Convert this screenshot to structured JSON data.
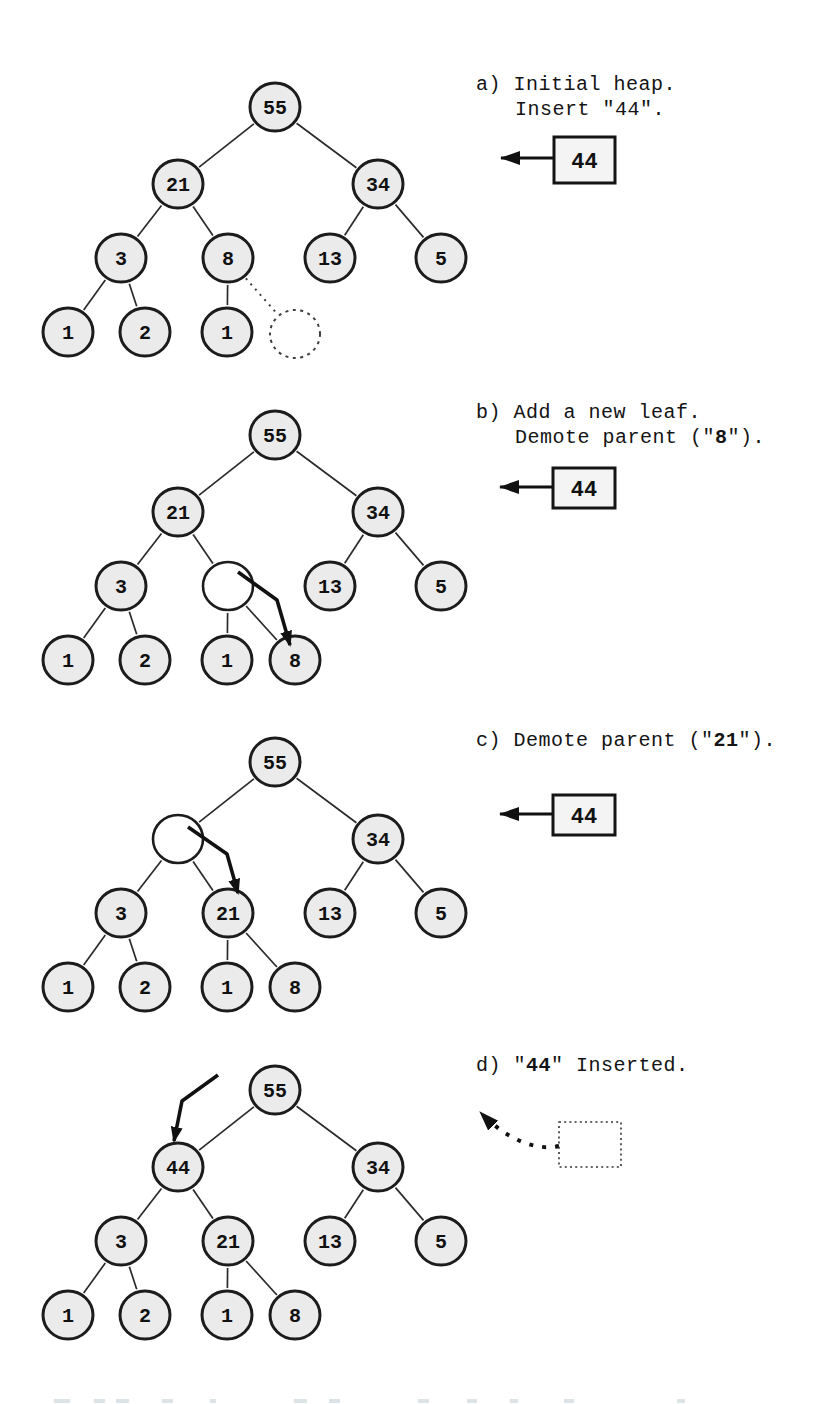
{
  "page": {
    "background": "#ffffff",
    "ink": "#1c1c1c"
  },
  "styles": {
    "node_fill": "#ebebeb",
    "empty_fill": "#ffffff",
    "edge_color": "#2b2b2b",
    "box_fill": "#f4f4f4",
    "accent": "#111111",
    "artifact_color": "#dde4e8"
  },
  "panels": [
    {
      "id": "a",
      "caption": {
        "x": 476,
        "y": 72,
        "lines": [
          {
            "indent": false,
            "segments": [
              {
                "text": "a) Initial heap."
              }
            ]
          },
          {
            "indent": true,
            "segments": [
              {
                "text": "Insert \"44\"."
              }
            ]
          }
        ]
      },
      "nodes": [
        {
          "key": "n55",
          "label": "55",
          "x": 275,
          "y": 107,
          "style": "filled"
        },
        {
          "key": "n21",
          "label": "21",
          "x": 178,
          "y": 184,
          "style": "filled"
        },
        {
          "key": "n34",
          "label": "34",
          "x": 378,
          "y": 184,
          "style": "filled"
        },
        {
          "key": "n3",
          "label": "3",
          "x": 121,
          "y": 258,
          "style": "filled"
        },
        {
          "key": "n8",
          "label": "8",
          "x": 228,
          "y": 258,
          "style": "filled"
        },
        {
          "key": "n13",
          "label": "13",
          "x": 330,
          "y": 258,
          "style": "filled"
        },
        {
          "key": "n5",
          "label": "5",
          "x": 441,
          "y": 258,
          "style": "filled"
        },
        {
          "key": "l1",
          "label": "1",
          "x": 68,
          "y": 332,
          "style": "filled"
        },
        {
          "key": "l2",
          "label": "2",
          "x": 145,
          "y": 332,
          "style": "filled"
        },
        {
          "key": "l3",
          "label": "1",
          "x": 227,
          "y": 332,
          "style": "filled"
        },
        {
          "key": "l4",
          "label": "",
          "x": 295,
          "y": 334,
          "style": "ghost"
        }
      ],
      "edges": [
        [
          "n55",
          "n21",
          "solid"
        ],
        [
          "n55",
          "n34",
          "solid"
        ],
        [
          "n21",
          "n3",
          "solid"
        ],
        [
          "n21",
          "n8",
          "solid"
        ],
        [
          "n34",
          "n13",
          "solid"
        ],
        [
          "n34",
          "n5",
          "solid"
        ],
        [
          "n3",
          "l1",
          "solid"
        ],
        [
          "n3",
          "l2",
          "solid"
        ],
        [
          "n8",
          "l3",
          "solid"
        ],
        [
          "n8",
          "l4",
          "dotted"
        ]
      ],
      "arrows": [],
      "insert_box": {
        "value": "44",
        "x": 554,
        "y": 137,
        "w": 61,
        "h": 46,
        "arrow_y": 158
      }
    },
    {
      "id": "b",
      "caption": {
        "x": 476,
        "y": 400,
        "lines": [
          {
            "indent": false,
            "segments": [
              {
                "text": "b) Add a new leaf."
              }
            ]
          },
          {
            "indent": true,
            "segments": [
              {
                "text": "Demote parent (\""
              },
              {
                "text": "8",
                "bold": true
              },
              {
                "text": "\")."
              }
            ]
          }
        ]
      },
      "nodes": [
        {
          "key": "n55",
          "label": "55",
          "x": 275,
          "y": 435,
          "style": "filled"
        },
        {
          "key": "n21",
          "label": "21",
          "x": 178,
          "y": 512,
          "style": "filled"
        },
        {
          "key": "n34",
          "label": "34",
          "x": 378,
          "y": 512,
          "style": "filled"
        },
        {
          "key": "n3",
          "label": "3",
          "x": 121,
          "y": 586,
          "style": "filled"
        },
        {
          "key": "nE",
          "label": "",
          "x": 228,
          "y": 586,
          "style": "empty"
        },
        {
          "key": "n13",
          "label": "13",
          "x": 330,
          "y": 586,
          "style": "filled"
        },
        {
          "key": "n5",
          "label": "5",
          "x": 441,
          "y": 586,
          "style": "filled"
        },
        {
          "key": "l1",
          "label": "1",
          "x": 68,
          "y": 660,
          "style": "filled"
        },
        {
          "key": "l2",
          "label": "2",
          "x": 145,
          "y": 660,
          "style": "filled"
        },
        {
          "key": "l3",
          "label": "1",
          "x": 227,
          "y": 660,
          "style": "filled"
        },
        {
          "key": "l4",
          "label": "8",
          "x": 295,
          "y": 660,
          "style": "filled"
        }
      ],
      "edges": [
        [
          "n55",
          "n21",
          "solid"
        ],
        [
          "n55",
          "n34",
          "solid"
        ],
        [
          "n21",
          "n3",
          "solid"
        ],
        [
          "n21",
          "nE",
          "solid"
        ],
        [
          "n34",
          "n13",
          "solid"
        ],
        [
          "n34",
          "n5",
          "solid"
        ],
        [
          "n3",
          "l1",
          "solid"
        ],
        [
          "n3",
          "l2",
          "solid"
        ],
        [
          "nE",
          "l3",
          "solid"
        ],
        [
          "nE",
          "l4",
          "solid"
        ]
      ],
      "arrows": [
        {
          "points": [
            [
              238,
              572
            ],
            [
              277,
              600
            ],
            [
              290,
              645
            ]
          ]
        }
      ],
      "insert_box": {
        "value": "44",
        "x": 553,
        "y": 468,
        "w": 62,
        "h": 40,
        "arrow_y": 487
      }
    },
    {
      "id": "c",
      "caption": {
        "x": 476,
        "y": 728,
        "lines": [
          {
            "indent": false,
            "segments": [
              {
                "text": "c) Demote parent (\""
              },
              {
                "text": "21",
                "bold": true
              },
              {
                "text": "\")."
              }
            ]
          }
        ]
      },
      "nodes": [
        {
          "key": "n55",
          "label": "55",
          "x": 275,
          "y": 762,
          "style": "filled"
        },
        {
          "key": "nE",
          "label": "",
          "x": 178,
          "y": 839,
          "style": "empty"
        },
        {
          "key": "n34",
          "label": "34",
          "x": 378,
          "y": 839,
          "style": "filled"
        },
        {
          "key": "n3",
          "label": "3",
          "x": 121,
          "y": 913,
          "style": "filled"
        },
        {
          "key": "n21",
          "label": "21",
          "x": 228,
          "y": 913,
          "style": "filled"
        },
        {
          "key": "n13",
          "label": "13",
          "x": 330,
          "y": 913,
          "style": "filled"
        },
        {
          "key": "n5",
          "label": "5",
          "x": 441,
          "y": 913,
          "style": "filled"
        },
        {
          "key": "l1",
          "label": "1",
          "x": 68,
          "y": 987,
          "style": "filled"
        },
        {
          "key": "l2",
          "label": "2",
          "x": 145,
          "y": 987,
          "style": "filled"
        },
        {
          "key": "l3",
          "label": "1",
          "x": 227,
          "y": 987,
          "style": "filled"
        },
        {
          "key": "l4",
          "label": "8",
          "x": 295,
          "y": 987,
          "style": "filled"
        }
      ],
      "edges": [
        [
          "n55",
          "nE",
          "solid"
        ],
        [
          "n55",
          "n34",
          "solid"
        ],
        [
          "nE",
          "n3",
          "solid"
        ],
        [
          "nE",
          "n21",
          "solid"
        ],
        [
          "n34",
          "n13",
          "solid"
        ],
        [
          "n34",
          "n5",
          "solid"
        ],
        [
          "n3",
          "l1",
          "solid"
        ],
        [
          "n3",
          "l2",
          "solid"
        ],
        [
          "n21",
          "l3",
          "solid"
        ],
        [
          "n21",
          "l4",
          "solid"
        ]
      ],
      "arrows": [
        {
          "points": [
            [
              188,
              827
            ],
            [
              227,
              854
            ],
            [
              238,
              893
            ]
          ]
        }
      ],
      "insert_box": {
        "value": "44",
        "x": 553,
        "y": 795,
        "w": 62,
        "h": 40,
        "arrow_y": 814
      }
    },
    {
      "id": "d",
      "caption": {
        "x": 476,
        "y": 1053,
        "lines": [
          {
            "indent": false,
            "segments": [
              {
                "text": "d) \""
              },
              {
                "text": "44",
                "bold": true
              },
              {
                "text": "\" Inserted."
              }
            ]
          }
        ]
      },
      "nodes": [
        {
          "key": "n55",
          "label": "55",
          "x": 275,
          "y": 1090,
          "style": "filled"
        },
        {
          "key": "n44",
          "label": "44",
          "x": 178,
          "y": 1167,
          "style": "filled"
        },
        {
          "key": "n34",
          "label": "34",
          "x": 378,
          "y": 1167,
          "style": "filled"
        },
        {
          "key": "n3",
          "label": "3",
          "x": 121,
          "y": 1241,
          "style": "filled"
        },
        {
          "key": "n21",
          "label": "21",
          "x": 228,
          "y": 1241,
          "style": "filled"
        },
        {
          "key": "n13",
          "label": "13",
          "x": 330,
          "y": 1241,
          "style": "filled"
        },
        {
          "key": "n5",
          "label": "5",
          "x": 441,
          "y": 1241,
          "style": "filled"
        },
        {
          "key": "l1",
          "label": "1",
          "x": 68,
          "y": 1315,
          "style": "filled"
        },
        {
          "key": "l2",
          "label": "2",
          "x": 145,
          "y": 1315,
          "style": "filled"
        },
        {
          "key": "l3",
          "label": "1",
          "x": 227,
          "y": 1315,
          "style": "filled"
        },
        {
          "key": "l4",
          "label": "8",
          "x": 295,
          "y": 1315,
          "style": "filled"
        }
      ],
      "edges": [
        [
          "n55",
          "n44",
          "solid"
        ],
        [
          "n55",
          "n34",
          "solid"
        ],
        [
          "n44",
          "n3",
          "solid"
        ],
        [
          "n44",
          "n21",
          "solid"
        ],
        [
          "n34",
          "n13",
          "solid"
        ],
        [
          "n34",
          "n5",
          "solid"
        ],
        [
          "n3",
          "l1",
          "solid"
        ],
        [
          "n3",
          "l2",
          "solid"
        ],
        [
          "n21",
          "l3",
          "solid"
        ],
        [
          "n21",
          "l4",
          "solid"
        ]
      ],
      "arrows": [
        {
          "points": [
            [
              218,
              1075
            ],
            [
              182,
              1101
            ],
            [
              174,
              1141
            ]
          ]
        }
      ],
      "ghost_box": {
        "x": 559,
        "y": 1122,
        "w": 62,
        "h": 45
      },
      "dashed_arrow_path": "M 559 1146 C 536 1151 507 1140 480 1112"
    }
  ],
  "artifacts": [
    {
      "x": 54,
      "w": 16
    },
    {
      "x": 94,
      "w": 11
    },
    {
      "x": 116,
      "w": 13
    },
    {
      "x": 162,
      "w": 11
    },
    {
      "x": 210,
      "w": 6
    },
    {
      "x": 294,
      "w": 13
    },
    {
      "x": 329,
      "w": 11
    },
    {
      "x": 418,
      "w": 11
    },
    {
      "x": 467,
      "w": 10
    },
    {
      "x": 510,
      "w": 8
    },
    {
      "x": 564,
      "w": 10
    },
    {
      "x": 677,
      "w": 8
    }
  ]
}
